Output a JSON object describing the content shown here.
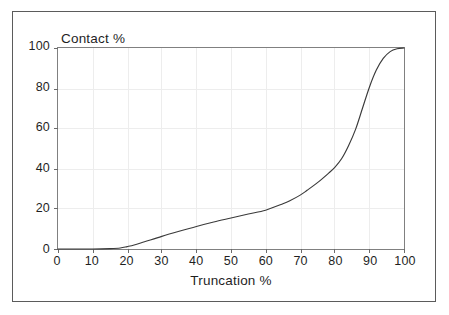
{
  "figure": {
    "background_color": "#ffffff",
    "frame_color": "#5b5b5b",
    "axis_color": "#808080",
    "grid_color": "#ededed",
    "curve_color": "#3a3a3a",
    "text_color": "#1f1f1f"
  },
  "chart_data": {
    "type": "line",
    "title": "",
    "subtitle": "",
    "xlabel": "Truncation %",
    "ylabel": "Contact %",
    "xlim": [
      0,
      100
    ],
    "ylim": [
      0,
      100
    ],
    "xticks": [
      0,
      10,
      20,
      30,
      40,
      50,
      60,
      70,
      80,
      90,
      100
    ],
    "xticklabels": [
      "0",
      "10",
      "20",
      "30",
      "40",
      "50",
      "60",
      "70",
      "80",
      "90",
      "100"
    ],
    "yticks": [
      0,
      20,
      40,
      60,
      80,
      100
    ],
    "yticklabels": [
      "0",
      "20",
      "40",
      "60",
      "80",
      "100"
    ],
    "grid": true,
    "grid_style": "faint major gridlines on both axes",
    "legend": null,
    "legend_position": "none",
    "annotations": [],
    "series": [
      {
        "name": "Contact vs Truncation",
        "color": "#3a3a3a",
        "x": [
          0,
          5,
          10,
          15,
          18,
          20,
          22,
          25,
          30,
          35,
          40,
          45,
          50,
          55,
          60,
          65,
          67,
          70,
          72,
          75,
          78,
          80,
          82,
          84,
          86,
          88,
          90,
          92,
          94,
          96,
          98,
          100
        ],
        "y": [
          0,
          0,
          0,
          0.2,
          0.5,
          1.2,
          2.0,
          3.6,
          6.3,
          8.8,
          11.2,
          13.4,
          15.4,
          17.4,
          19.3,
          22.5,
          24.0,
          26.8,
          29.2,
          33.0,
          37.4,
          40.6,
          45.0,
          51.5,
          59.5,
          70.0,
          80.5,
          89.0,
          94.8,
          98.2,
          99.6,
          100
        ]
      }
    ]
  }
}
